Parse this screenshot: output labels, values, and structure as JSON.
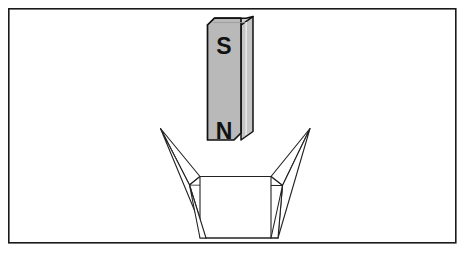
{
  "figure": {
    "background_color": "#ffffff",
    "frame": {
      "name": "outer-border",
      "stroke_color": "#1a1a1a",
      "fill_color": "#ffffff",
      "x": 8,
      "y": 8,
      "width": 448,
      "height": 235,
      "stroke_width": 1.6
    },
    "magnet": {
      "name": "bar-magnet",
      "description": "vertical rectangular bar magnet drawn in three-quarter perspective",
      "fill_color": "#b9b9b9",
      "top_face_color": "#cfcfcf",
      "side_face_color": "#c8c8c8",
      "stroke_color": "#111111",
      "stroke_width": 1.6,
      "front_face": {
        "left": 207,
        "right": 241,
        "top": 18,
        "bottom": 147
      },
      "depth_x": 12,
      "depth_y": 9,
      "chamfer": 7,
      "poles": [
        {
          "label": "S",
          "pole_name": "south-pole",
          "x": 224,
          "y": 47
        },
        {
          "label": "N",
          "pole_name": "north-pole",
          "x": 224,
          "y": 132
        }
      ]
    },
    "funnel": {
      "name": "funnel-hopper",
      "description": "open four-sided funnel with flared triangular wings below the magnet",
      "fill_color": "#ffffff",
      "stroke_color": "#222222",
      "stroke_width": 1.2,
      "mouth": {
        "left": 160,
        "right": 310,
        "top": 128
      },
      "throat": {
        "left": 200,
        "right": 271,
        "top": 176,
        "bottom": 238
      },
      "outlet": {
        "left": 206,
        "right": 278,
        "y": 238
      }
    }
  }
}
